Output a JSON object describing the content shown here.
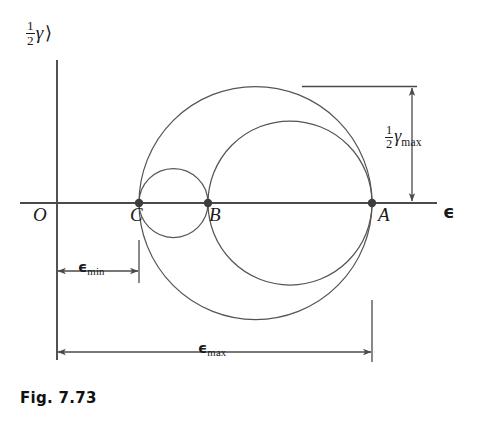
{
  "figure": {
    "caption": "Fig. 7.73",
    "axes": {
      "x_label": "ϵ",
      "y_label_fraction_numerator": "1",
      "y_label_fraction_denominator": "2",
      "y_label_symbol": "γ",
      "y_label_rotation_glyph": "⟩"
    },
    "points": [
      {
        "name": "origin",
        "label": "O",
        "x": 57,
        "y": 203
      },
      {
        "name": "point-c",
        "label": "C",
        "x": 139,
        "y": 203
      },
      {
        "name": "point-b",
        "label": "B",
        "x": 208,
        "y": 203
      },
      {
        "name": "point-a",
        "label": "A",
        "x": 372,
        "y": 203
      }
    ],
    "circles": [
      {
        "name": "outer-circle-ca",
        "cx": 255.5,
        "cy": 203,
        "r": 116.5
      },
      {
        "name": "middle-circle-ba",
        "cx": 290,
        "cy": 203,
        "r": 82
      },
      {
        "name": "small-circle-cb",
        "cx": 173.5,
        "cy": 203,
        "r": 34.5
      }
    ],
    "dimensions": {
      "gamma_max": {
        "fraction_numerator": "1",
        "fraction_denominator": "2",
        "symbol": "γ",
        "subscript": "max"
      },
      "epsilon_min": {
        "symbol": "ϵ",
        "subscript": "min"
      },
      "epsilon_max": {
        "symbol": "ϵ",
        "subscript": "max"
      }
    },
    "colors": {
      "stroke": "#555555",
      "axis": "#4a4a4a",
      "text": "#1a1a1a",
      "background": "#ffffff"
    }
  }
}
